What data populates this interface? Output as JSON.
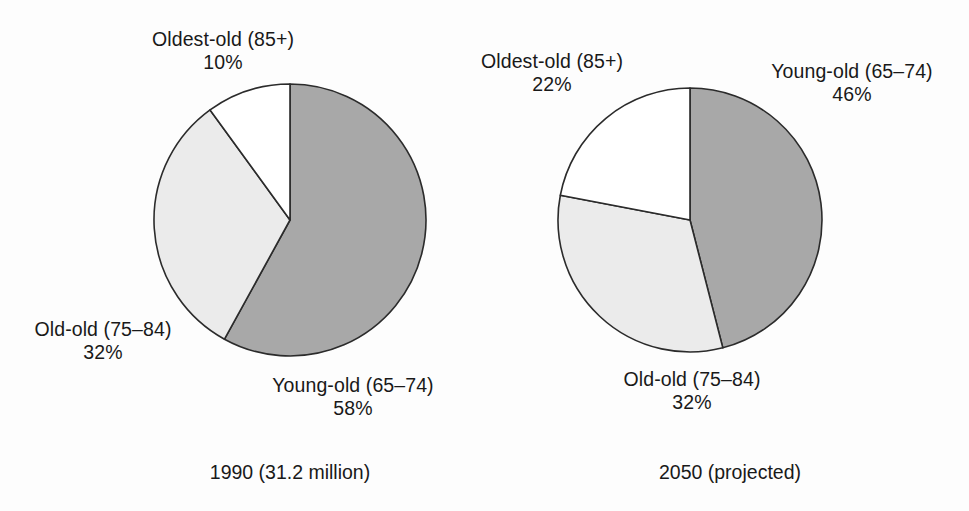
{
  "figure": {
    "background": "#fdfdfd",
    "text_color": "#191919"
  },
  "palette": {
    "young_old": "#a8a8a8",
    "old_old": "#ebebeb",
    "oldest_old": "#ffffff",
    "outline": "#2b2b2b"
  },
  "charts": {
    "left": {
      "caption": "1990 (31.2 million)",
      "labels": {
        "oldest_old_name": "Oldest-old (85+)",
        "oldest_old_pct": "10%",
        "old_old_name": "Old-old (75–84)",
        "old_old_pct": "32%",
        "young_old_name": "Young-old (65–74)",
        "young_old_pct": "58%"
      }
    },
    "right": {
      "caption": "2050 (projected)",
      "labels": {
        "oldest_old_name": "Oldest-old (85+)",
        "oldest_old_pct": "22%",
        "old_old_name": "Old-old (75–84)",
        "old_old_pct": "32%",
        "young_old_name": "Young-old (65–74)",
        "young_old_pct": "46%"
      }
    }
  },
  "chart_data": [
    {
      "type": "pie",
      "title": "1990 (31.2 million)",
      "labels": [
        "Young-old (65–74)",
        "Old-old (75–84)",
        "Oldest-old (85+)"
      ],
      "values": [
        58,
        32,
        10
      ],
      "value_labels": [
        "58%",
        "32%",
        "10%"
      ],
      "units": "percent",
      "total_label": "31.2 million",
      "start_angle_deg": 0,
      "direction": "clockwise",
      "slice_colors": [
        "#a8a8a8",
        "#ebebeb",
        "#ffffff"
      ],
      "center": [
        290,
        220
      ],
      "radius": 136,
      "legend": "none",
      "grid": false
    },
    {
      "type": "pie",
      "title": "2050 (projected)",
      "labels": [
        "Young-old (65–74)",
        "Old-old (75–84)",
        "Oldest-old (85+)"
      ],
      "values": [
        46,
        32,
        22
      ],
      "value_labels": [
        "46%",
        "32%",
        "22%"
      ],
      "units": "percent",
      "total_label": "projected",
      "start_angle_deg": 0,
      "direction": "clockwise",
      "slice_colors": [
        "#a8a8a8",
        "#ebebeb",
        "#ffffff"
      ],
      "center": [
        690,
        220
      ],
      "radius": 132,
      "legend": "none",
      "grid": false
    }
  ]
}
